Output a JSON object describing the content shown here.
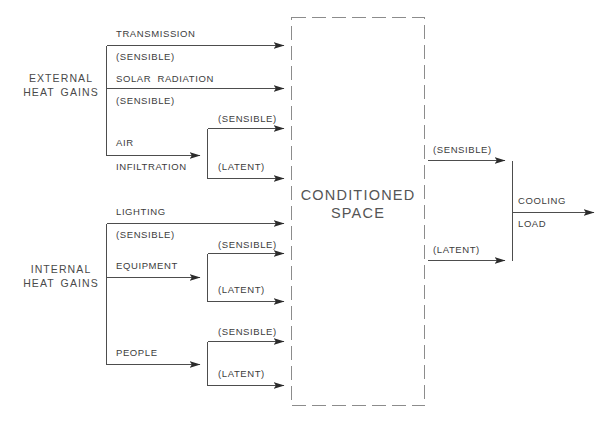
{
  "diagram": {
    "colors": {
      "line": "#4d4d4d",
      "dashed_box": "#8c8c8c",
      "text": "#3c3c3c",
      "background": "#ffffff"
    },
    "groups": {
      "external": {
        "line1": "EXTERNAL",
        "line2": "HEAT GAINS"
      },
      "internal": {
        "line1": "INTERNAL",
        "line2": "HEAT GAINS"
      }
    },
    "space": {
      "line1": "CONDITIONED",
      "line2": "SPACE"
    },
    "output": {
      "line1": "COOLING",
      "line2": "LOAD"
    },
    "external_sources": [
      {
        "name": "TRANSMISSION",
        "sub": "(SENSIBLE)",
        "split": false
      },
      {
        "name": "SOLAR RADIATION",
        "sub": "(SENSIBLE)",
        "split": false
      },
      {
        "name": "AIR",
        "name2": "INFILTRATION",
        "sensible": "(SENSIBLE)",
        "latent": "(LATENT)",
        "split": true
      }
    ],
    "internal_sources": [
      {
        "name": "LIGHTING",
        "sub": "(SENSIBLE)",
        "split": false
      },
      {
        "name": "EQUIPMENT",
        "sensible": "(SENSIBLE)",
        "latent": "(LATENT)",
        "split": true
      },
      {
        "name": "PEOPLE",
        "sensible": "(SENSIBLE)",
        "latent": "(LATENT)",
        "split": true
      }
    ],
    "space_outputs": {
      "sensible": "(SENSIBLE)",
      "latent": "(LATENT)"
    },
    "labels": {
      "transmission": "TRANSMISSION",
      "transmission_sub": "(SENSIBLE)",
      "solar": "SOLAR RADIATION",
      "solar_sub": "(SENSIBLE)",
      "air": "AIR",
      "infiltration": "INFILTRATION",
      "air_sensible": "(SENSIBLE)",
      "air_latent": "(LATENT)",
      "lighting": "LIGHTING",
      "lighting_sub": "(SENSIBLE)",
      "equipment": "EQUIPMENT",
      "equipment_sensible": "(SENSIBLE)",
      "equipment_latent": "(LATENT)",
      "people": "PEOPLE",
      "people_sensible": "(SENSIBLE)",
      "people_latent": "(LATENT)",
      "out_sensible": "(SENSIBLE)",
      "out_latent": "(LATENT)"
    }
  }
}
